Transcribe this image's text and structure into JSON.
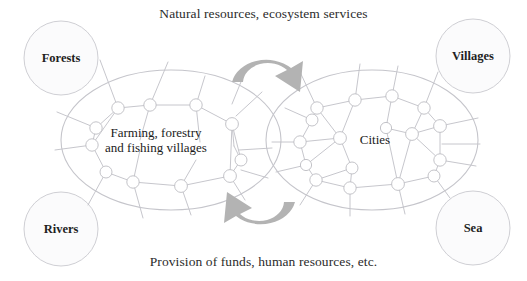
{
  "figure": {
    "background_color": "#ffffff",
    "line_color": "#b9b9bd",
    "arrow_color": "#b0b0b0",
    "text_color": "#1f1f1f"
  },
  "captions": {
    "top": "Natural resources, ecosystem services",
    "bottom": "Provision of funds, human resources, etc."
  },
  "regions": [
    {
      "id": "rural",
      "label_line1": "Farming, forestry",
      "label_line2": "and fishing villages"
    },
    {
      "id": "urban",
      "label_line1": "Cities",
      "label_line2": ""
    }
  ],
  "corner_nodes": [
    {
      "id": "forests",
      "label": "Forests",
      "position": "top-left"
    },
    {
      "id": "villages",
      "label": "Villages",
      "position": "top-right"
    },
    {
      "id": "rivers",
      "label": "Rivers",
      "position": "bottom-left"
    },
    {
      "id": "sea",
      "label": "Sea",
      "position": "bottom-right"
    }
  ],
  "arrows": [
    {
      "id": "arrow-top",
      "direction": "left-to-right",
      "meaning": "Natural resources, ecosystem services"
    },
    {
      "id": "arrow-bottom",
      "direction": "right-to-left",
      "meaning": "Provision of funds, human resources, etc."
    }
  ]
}
